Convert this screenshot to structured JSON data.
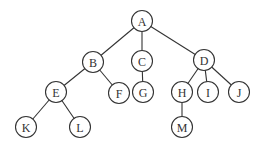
{
  "diagram": {
    "type": "tree",
    "root": "A",
    "node_radius": 10.5,
    "colors": {
      "stroke": "#333333",
      "fill": "#ffffff",
      "text": "#333333",
      "background": "#ffffff"
    },
    "nodes": [
      {
        "id": "A",
        "label": "A",
        "x": 142,
        "y": 21
      },
      {
        "id": "B",
        "label": "B",
        "x": 93,
        "y": 62
      },
      {
        "id": "C",
        "label": "C",
        "x": 142,
        "y": 61
      },
      {
        "id": "D",
        "label": "D",
        "x": 204,
        "y": 60
      },
      {
        "id": "E",
        "label": "E",
        "x": 56,
        "y": 92
      },
      {
        "id": "F",
        "label": "F",
        "x": 119,
        "y": 93
      },
      {
        "id": "G",
        "label": "G",
        "x": 143,
        "y": 92
      },
      {
        "id": "H",
        "label": "H",
        "x": 182,
        "y": 92
      },
      {
        "id": "I",
        "label": "I",
        "x": 208,
        "y": 92
      },
      {
        "id": "J",
        "label": "J",
        "x": 239,
        "y": 92
      },
      {
        "id": "K",
        "label": "K",
        "x": 26,
        "y": 127
      },
      {
        "id": "L",
        "label": "L",
        "x": 80,
        "y": 127
      },
      {
        "id": "M",
        "label": "M",
        "x": 182,
        "y": 127
      }
    ],
    "edges": [
      {
        "from": "A",
        "to": "B"
      },
      {
        "from": "A",
        "to": "C"
      },
      {
        "from": "A",
        "to": "D"
      },
      {
        "from": "B",
        "to": "E"
      },
      {
        "from": "B",
        "to": "F"
      },
      {
        "from": "C",
        "to": "G"
      },
      {
        "from": "D",
        "to": "H"
      },
      {
        "from": "D",
        "to": "I"
      },
      {
        "from": "D",
        "to": "J"
      },
      {
        "from": "E",
        "to": "K"
      },
      {
        "from": "E",
        "to": "L"
      },
      {
        "from": "H",
        "to": "M"
      }
    ]
  }
}
